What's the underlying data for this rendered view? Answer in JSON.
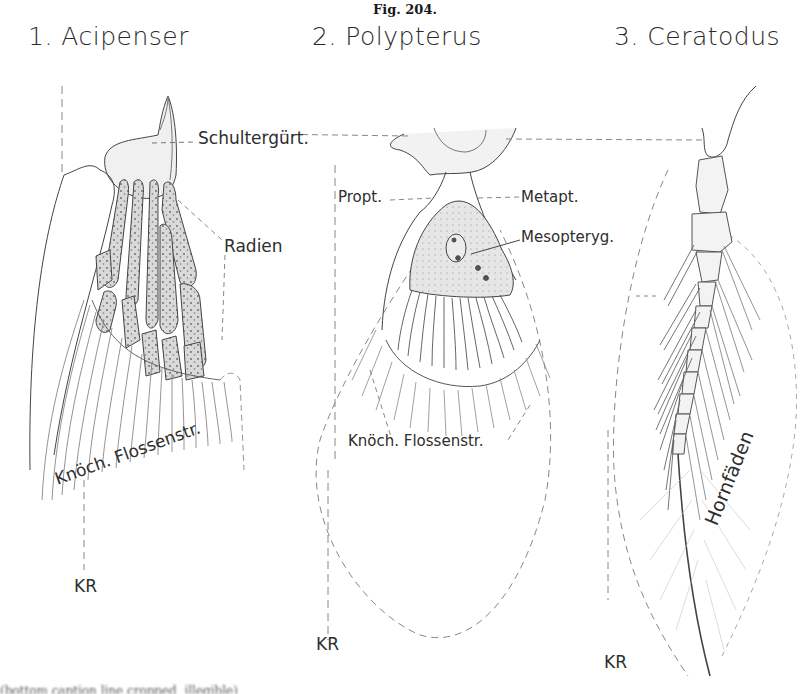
{
  "figure": {
    "number": "Fig. 204.",
    "panels": [
      {
        "index": 1,
        "title": "1. Acipenser",
        "labels": {
          "girdle": "Schultergürt.",
          "radials": "Radien",
          "bony_rays": "Knöch. Flossenstr.",
          "kr": "KR"
        }
      },
      {
        "index": 2,
        "title": "2. Polypterus",
        "labels": {
          "propterygium": "Propt.",
          "metapterygium": "Metapt.",
          "mesopterygium": "Mesopteryg.",
          "bony_rays": "Knöch. Flossenstr.",
          "kr": "KR"
        }
      },
      {
        "index": 3,
        "title": "3. Ceratodus",
        "labels": {
          "horny_rays": "Hornfäden",
          "kr": "KR"
        }
      }
    ],
    "caption_partial": "(bottom caption line cropped, illegible)"
  },
  "colors": {
    "ink": "#2e2e2e",
    "stipple_fill": "#d8d8d8",
    "dashed_line": "#8a8a8a",
    "background": "#ffffff"
  }
}
